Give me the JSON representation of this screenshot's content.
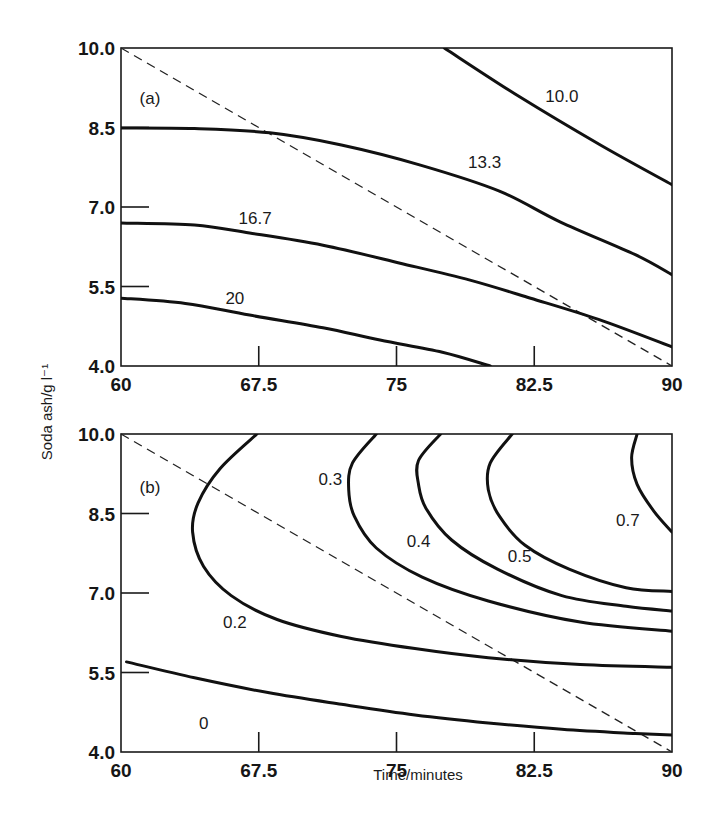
{
  "figure": {
    "xlabel": "Time/minutes",
    "ylabel": "Soda ash/g l⁻¹",
    "colors": {
      "line": "#111111",
      "background": "#ffffff"
    }
  },
  "chart_data": [
    {
      "type": "line",
      "subtype": "contour",
      "panel": "(a)",
      "title": "",
      "xlabel": "Time/minutes",
      "ylabel": "Soda ash/g l⁻¹",
      "xlim": [
        60,
        90
      ],
      "ylim": [
        4.0,
        10.0
      ],
      "xticks": [
        "60",
        "67.5",
        "75",
        "82.5",
        "90"
      ],
      "yticks": [
        "4.0",
        "5.5",
        "7.0",
        "8.5",
        "10.0"
      ],
      "grid": false,
      "legend": "none",
      "dashed_line": {
        "x": [
          60,
          90
        ],
        "y": [
          10.0,
          4.0
        ]
      },
      "series": [
        {
          "name": "10.0",
          "x": [
            77.6,
            81.7,
            86.1,
            90.0
          ],
          "y": [
            10.0,
            9.08,
            8.17,
            7.42
          ],
          "label_pos": [
            84.0,
            9.1
          ]
        },
        {
          "name": "13.3",
          "x": [
            60,
            64,
            68.1,
            72.0,
            76.3,
            80.6,
            83.9,
            88.0,
            90.0
          ],
          "y": [
            8.49,
            8.48,
            8.4,
            8.17,
            7.79,
            7.3,
            6.72,
            6.1,
            5.72
          ],
          "label_pos": [
            79.8,
            7.85
          ]
        },
        {
          "name": "16.7",
          "x": [
            60,
            64,
            67.0,
            71.0,
            75.2,
            79.0,
            82.3,
            86.0,
            90.0
          ],
          "y": [
            6.7,
            6.66,
            6.51,
            6.28,
            5.94,
            5.62,
            5.28,
            4.88,
            4.36
          ],
          "label_pos": [
            67.3,
            6.8
          ]
        },
        {
          "name": "20",
          "x": [
            60,
            63.5,
            67.0,
            71.0,
            74.1,
            77.5,
            80.1
          ],
          "y": [
            5.28,
            5.18,
            4.96,
            4.72,
            4.49,
            4.26,
            4.0
          ],
          "label_pos": [
            66.2,
            5.28
          ]
        }
      ],
      "annotations": [
        "(a)",
        "10.0",
        "13.3",
        "16.7",
        "20"
      ]
    },
    {
      "type": "line",
      "subtype": "contour",
      "panel": "(b)",
      "title": "",
      "xlabel": "Time/minutes",
      "ylabel": "Soda ash/g l⁻¹",
      "xlim": [
        60,
        90
      ],
      "ylim": [
        4.0,
        10.0
      ],
      "xticks": [
        "60",
        "67.5",
        "75",
        "82.5",
        "90"
      ],
      "yticks": [
        "4.0",
        "5.5",
        "7.0",
        "8.5",
        "10.0"
      ],
      "grid": false,
      "legend": "none",
      "dashed_line": {
        "x": [
          60,
          90
        ],
        "y": [
          10.0,
          4.0
        ]
      },
      "series": [
        {
          "name": "0",
          "x": [
            60.3,
            64,
            68,
            72,
            76,
            80,
            84,
            88,
            90
          ],
          "y": [
            5.7,
            5.4,
            5.12,
            4.9,
            4.7,
            4.55,
            4.43,
            4.35,
            4.32
          ],
          "label_pos": [
            64.5,
            4.55
          ]
        },
        {
          "name": "0.2",
          "x": [
            67.4,
            65.4,
            64.2,
            63.9,
            64.5,
            66.0,
            68.5,
            72.0,
            76.0,
            80.0,
            85.0,
            90.0
          ],
          "y": [
            10.0,
            9.35,
            8.7,
            8.15,
            7.5,
            6.95,
            6.5,
            6.18,
            5.95,
            5.78,
            5.65,
            5.6
          ],
          "label_pos": [
            66.2,
            6.45
          ]
        },
        {
          "name": "0.3",
          "x": [
            73.9,
            72.6,
            72.4,
            72.7,
            73.9,
            76.4,
            80.0,
            85.0,
            90.0
          ],
          "y": [
            10.0,
            9.45,
            8.95,
            8.45,
            7.85,
            7.3,
            6.85,
            6.45,
            6.28
          ],
          "label_pos": [
            71.4,
            9.15
          ]
        },
        {
          "name": "0.4",
          "x": [
            77.4,
            76.2,
            76.2,
            76.6,
            78.0,
            80.5,
            84.0,
            87.5,
            90.0
          ],
          "y": [
            10.0,
            9.5,
            9.05,
            8.6,
            8.0,
            7.45,
            6.95,
            6.75,
            6.66
          ],
          "label_pos": [
            76.2,
            7.98
          ]
        },
        {
          "name": "0.5",
          "x": [
            81.3,
            80.1,
            80.0,
            80.6,
            82.0,
            84.4,
            87.5,
            90.0
          ],
          "y": [
            10.0,
            9.45,
            8.95,
            8.45,
            7.9,
            7.45,
            7.1,
            7.03
          ],
          "label_pos": [
            81.7,
            7.7
          ]
        },
        {
          "name": "0.7",
          "x": [
            88.1,
            87.8,
            88.1,
            89.0,
            90.0
          ],
          "y": [
            10.0,
            9.55,
            9.05,
            8.55,
            8.15
          ],
          "label_pos": [
            87.6,
            8.38
          ]
        }
      ],
      "annotations": [
        "(b)",
        "0",
        "0.2",
        "0.3",
        "0.4",
        "0.5",
        "0.7"
      ]
    }
  ],
  "layout": {
    "panels": [
      {
        "left": 121,
        "top": 48,
        "width": 551,
        "height": 318
      },
      {
        "left": 121,
        "top": 434,
        "width": 551,
        "height": 318
      }
    ],
    "panel_label_pos": [
      [
        150,
        104
      ],
      [
        150,
        493
      ]
    ]
  }
}
